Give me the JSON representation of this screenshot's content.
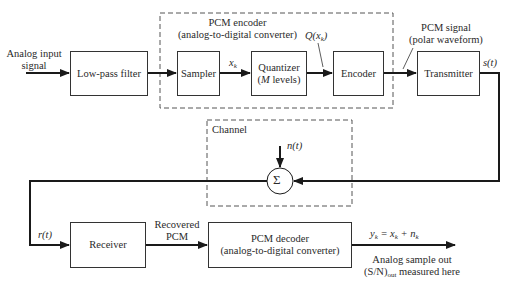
{
  "diagram": {
    "input_label_line1": "Analog input",
    "input_label_line2": "signal",
    "blocks": {
      "lowpass": "Low-pass filter",
      "sampler": "Sampler",
      "quantizer_line1": "Quantizer",
      "quantizer_line2_var": "M",
      "quantizer_line2_rest": " levels)",
      "encoder": "Encoder",
      "transmitter": "Transmitter",
      "receiver": "Receiver",
      "decoder_line1": "PCM decoder",
      "decoder_line2": "(analog-to-digital converter)",
      "sum": "Σ"
    },
    "groups": {
      "encoder_group_line1": "PCM encoder",
      "encoder_group_line2": "(analog-to-digital converter)",
      "channel": "Channel"
    },
    "signals": {
      "xk": "x",
      "xk_sub": "k",
      "qxk": "Q(x",
      "qxk_sub": "k",
      "qxk_close": ")",
      "pcm_signal_line1": "PCM signal",
      "pcm_signal_line2": "(polar waveform)",
      "st": "s(t)",
      "nt": "n(t)",
      "rt": "r(t)",
      "recovered_line1": "Recovered",
      "recovered_line2": "PCM",
      "output_eq": "y",
      "output_eq_sub": "k",
      "output_eq_mid": " = x",
      "output_eq_sub2": "k",
      "output_eq_plus": " + n",
      "output_eq_sub3": "k",
      "output_line1": "Analog sample out",
      "output_line2_pre": "(S/N)",
      "output_line2_sub": "out",
      "output_line2_post": " measured here"
    },
    "colors": {
      "line": "#1a1a1a",
      "dashed": "#555555",
      "text": "#2a2a2a"
    }
  }
}
